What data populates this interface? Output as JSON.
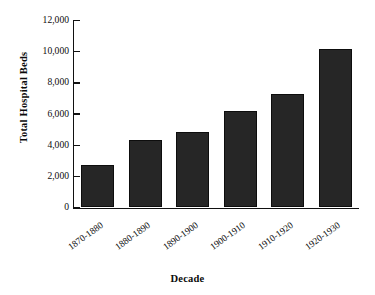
{
  "chart_data": {
    "type": "bar",
    "title": "",
    "xlabel": "Decade",
    "ylabel": "Total Hospital Beds",
    "categories": [
      "1870-1880",
      "1880-1890",
      "1890-1900",
      "1900-1910",
      "1910-1920",
      "1920-1930"
    ],
    "values": [
      2750,
      4300,
      4850,
      6200,
      7300,
      10150
    ],
    "ylim": [
      0,
      12000
    ],
    "ytick_labels": [
      "0",
      "2,000",
      "4,000",
      "6,000",
      "8,000",
      "10,000",
      "12,000"
    ],
    "ytick_values": [
      0,
      2000,
      4000,
      6000,
      8000,
      10000,
      12000
    ],
    "grid": false,
    "legend": false,
    "legend_position": "none",
    "bar_color": "#262626",
    "axis_color": "#111111",
    "background_color": "#ffffff"
  }
}
